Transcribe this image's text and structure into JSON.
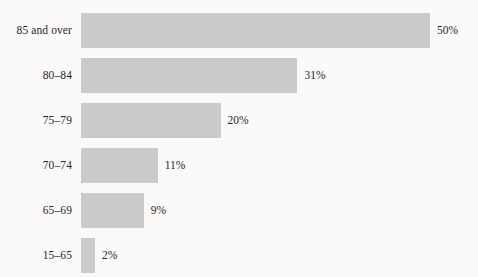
{
  "chart_data": {
    "type": "bar",
    "orientation": "horizontal",
    "title": "",
    "subtitle": "",
    "xlabel": "",
    "ylabel": "",
    "categories": [
      "85 and over",
      "80–84",
      "75–79",
      "70–74",
      "65–69",
      "15–65"
    ],
    "values": [
      50,
      31,
      20,
      11,
      9,
      2
    ],
    "value_labels": [
      "50%",
      "31%",
      "20%",
      "11%",
      "9%",
      "2%"
    ],
    "xlim": [
      0,
      50
    ],
    "grid": false,
    "legend": null,
    "annotations": [],
    "bars": [
      {
        "category": "85 and over",
        "value": 50,
        "value_label": "50%"
      },
      {
        "category": "80–84",
        "value": 31,
        "value_label": "31%"
      },
      {
        "category": "75–79",
        "value": 20,
        "value_label": "20%"
      },
      {
        "category": "70–74",
        "value": 11,
        "value_label": "11%"
      },
      {
        "category": "65–69",
        "value": 9,
        "value_label": "9%"
      },
      {
        "category": "15–65",
        "value": 2,
        "value_label": "2%"
      }
    ]
  },
  "style": {
    "bar_color": "#cacaca",
    "text_color": "#26262a",
    "background": "#fbfaf8"
  }
}
